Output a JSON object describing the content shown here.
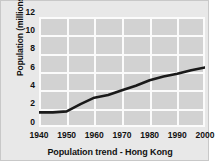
{
  "chart_data": {
    "type": "line",
    "title": "Population trend - Hong Kong",
    "xlabel": "",
    "ylabel": "Population (millions)",
    "x": [
      1940,
      1945,
      1950,
      1955,
      1960,
      1965,
      1970,
      1975,
      1980,
      1985,
      1990,
      1995,
      2000
    ],
    "values": [
      1.6,
      1.6,
      1.7,
      2.5,
      3.2,
      3.5,
      4.0,
      4.5,
      5.1,
      5.5,
      5.8,
      6.2,
      6.5
    ],
    "series": [
      {
        "name": "Population",
        "values": [
          1.6,
          1.6,
          1.7,
          2.5,
          3.2,
          3.5,
          4.0,
          4.5,
          5.1,
          5.5,
          5.8,
          6.2,
          6.5
        ]
      }
    ],
    "xlim": [
      1940,
      2000
    ],
    "ylim": [
      0,
      12
    ],
    "xticks": [
      1940,
      1950,
      1960,
      1970,
      1980,
      1990,
      2000
    ],
    "yticks": [
      0,
      2,
      4,
      6,
      8,
      10,
      12
    ],
    "xtick_labels": [
      "1940",
      "1950",
      "1960",
      "1970",
      "1980",
      "1990",
      "2000"
    ],
    "ytick_labels": [
      "0",
      "2",
      "4",
      "6",
      "8",
      "10",
      "12"
    ],
    "grid": true,
    "legend": false,
    "legend_position": "none",
    "colors": {
      "figure_background": "#e8e8e8",
      "plot_background": "#d2d2d2",
      "gridline": "#fbfbfb",
      "line": "#1a1a1a",
      "text": "#111111",
      "border": "#c8c8c8"
    },
    "line_width": 2.6
  }
}
